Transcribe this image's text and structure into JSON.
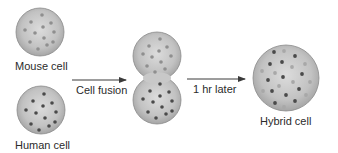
{
  "diagram": {
    "colors": {
      "background": "#ffffff",
      "cell_fill_light": "#d6d6d6",
      "cell_fill_dark": "#a8a8a8",
      "cell_stroke": "#8a8a8a",
      "mouse_marker": "#8f8f8f",
      "human_marker": "#4a4a4a",
      "arrow": "#3a3a3a",
      "text": "#2b2b2b"
    },
    "nodes": [
      {
        "id": "mouse",
        "label": "Mouse cell",
        "shape": "circle",
        "cx": 40,
        "cy": 32,
        "r": 24,
        "marker_type": "mouse"
      },
      {
        "id": "human",
        "label": "Human cell",
        "shape": "circle",
        "cx": 41,
        "cy": 110,
        "r": 24,
        "marker_type": "human"
      },
      {
        "id": "fused",
        "label": "",
        "shape": "double-circle",
        "top": {
          "cx": 157,
          "cy": 56,
          "r": 24,
          "marker_type": "mouse"
        },
        "bottom": {
          "cx": 157,
          "cy": 100,
          "r": 24,
          "marker_type": "human"
        }
      },
      {
        "id": "hybrid",
        "label": "Hybrid cell",
        "shape": "circle",
        "cx": 286,
        "cy": 78,
        "r": 33,
        "marker_type": "mixed"
      }
    ],
    "edges": [
      {
        "from": "mouse+human",
        "to": "fused",
        "label": "Cell fusion",
        "x1": 72,
        "x2": 126,
        "y": 80
      },
      {
        "from": "fused",
        "to": "hybrid",
        "label": "1 hr later",
        "x1": 187,
        "x2": 245,
        "y": 79
      }
    ],
    "labels": {
      "mouse": "Mouse cell",
      "human": "Human cell",
      "hybrid": "Hybrid cell",
      "edge1": "Cell fusion",
      "edge2": "1 hr later"
    }
  }
}
